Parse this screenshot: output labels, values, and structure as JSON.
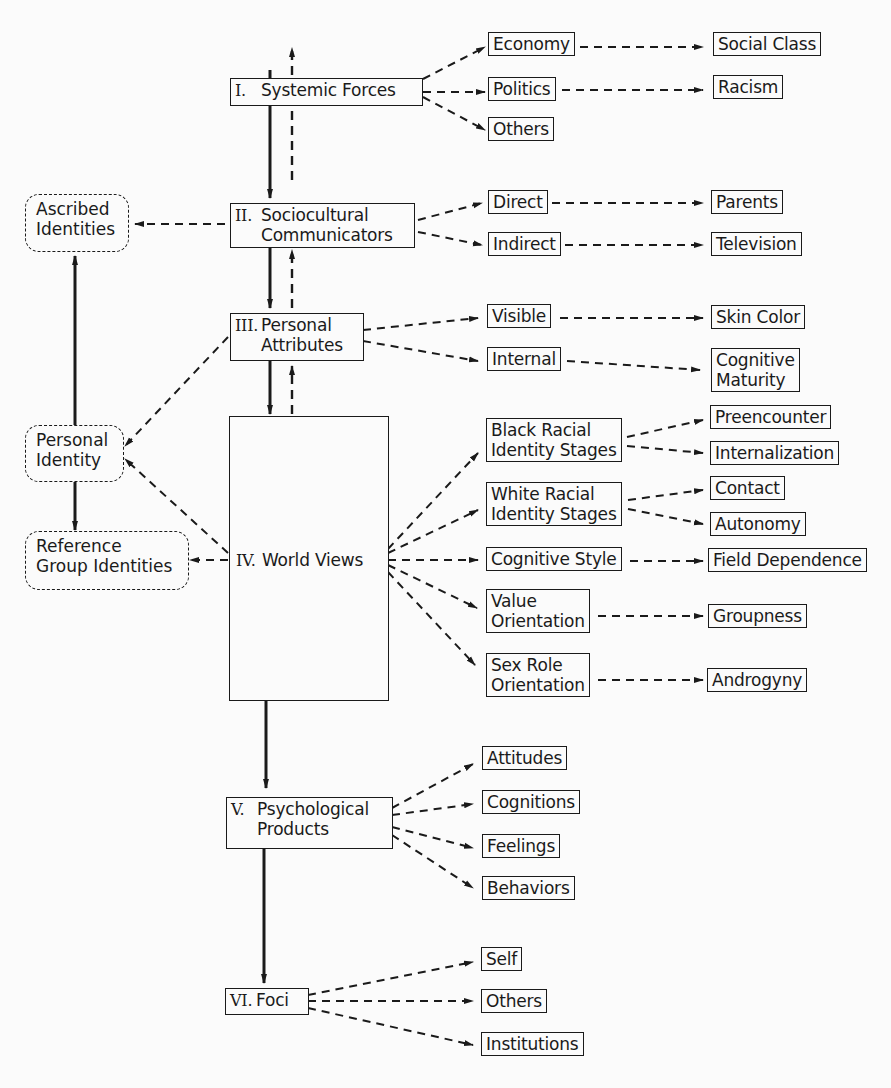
{
  "diagram": {
    "type": "flow",
    "main_chain": [
      {
        "id": "systemic",
        "numeral": "I.",
        "label": "Systemic Forces"
      },
      {
        "id": "sociocultural",
        "numeral": "II.",
        "label_line1": "Sociocultural",
        "label_line2": "Communicators"
      },
      {
        "id": "personal_attr",
        "numeral": "III.",
        "label_line1": "Personal",
        "label_line2": "Attributes"
      },
      {
        "id": "world_views",
        "numeral": "IV.",
        "label": "World Views"
      },
      {
        "id": "psych_products",
        "numeral": "V.",
        "label_line1": "Psychological",
        "label_line2": "Products"
      },
      {
        "id": "foci",
        "numeral": "VI.",
        "label": "Foci"
      }
    ],
    "identities": {
      "ascribed": {
        "line1": "Ascribed",
        "line2": "Identities"
      },
      "personal": {
        "line1": "Personal",
        "line2": "Identity"
      },
      "reference": {
        "line1": "Reference",
        "line2": "Group Identities"
      }
    },
    "branches": {
      "systemic": [
        {
          "label": "Economy",
          "leaf": "Social Class"
        },
        {
          "label": "Politics",
          "leaf": "Racism"
        },
        {
          "label": "Others",
          "leaf": null
        }
      ],
      "sociocultural": [
        {
          "label": "Direct",
          "leaf": "Parents"
        },
        {
          "label": "Indirect",
          "leaf": "Television"
        }
      ],
      "personal_attr": [
        {
          "label": "Visible",
          "leaf": "Skin Color"
        },
        {
          "label": "Internal",
          "leaf_line1": "Cognitive",
          "leaf_line2": "Maturity"
        }
      ],
      "world_views": [
        {
          "line1": "Black Racial",
          "line2": "Identity Stages",
          "leaves": [
            "Preencounter",
            "Internalization"
          ]
        },
        {
          "line1": "White Racial",
          "line2": "Identity Stages",
          "leaves": [
            "Contact",
            "Autonomy"
          ]
        },
        {
          "label": "Cognitive Style",
          "leaf": "Field Dependence"
        },
        {
          "line1": "Value",
          "line2": "Orientation",
          "leaf": "Groupness"
        },
        {
          "line1": "Sex Role",
          "line2": "Orientation",
          "leaf": "Androgyny"
        }
      ],
      "psych_products": [
        "Attitudes",
        "Cognitions",
        "Feelings",
        "Behaviors"
      ],
      "foci": [
        "Self",
        "Others",
        "Institutions"
      ]
    }
  }
}
